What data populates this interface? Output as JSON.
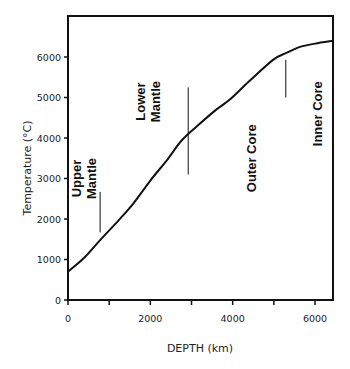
{
  "chart_data": {
    "type": "line",
    "title": "",
    "xlabel": "DEPTH (km)",
    "ylabel": "Temperature (°C)",
    "xlim": [
      0,
      6440
    ],
    "ylim": [
      0,
      6400
    ],
    "grid": false,
    "x_ticks": [
      0,
      1000,
      2000,
      3000,
      4000,
      5000,
      6000
    ],
    "x_tick_labels": [
      "0",
      "",
      "2000",
      "",
      "4000",
      "",
      "6000"
    ],
    "y_ticks": [
      0,
      1000,
      2000,
      3000,
      4000,
      5000,
      6000
    ],
    "y_tick_labels": [
      "0",
      "1000",
      "2000",
      "3000",
      "4000",
      "5000",
      "6000"
    ],
    "series": [
      {
        "name": "Earth temperature profile",
        "x": [
          0,
          400,
          780,
          1240,
          1600,
          2000,
          2400,
          2770,
          3200,
          3600,
          3930,
          4400,
          4980,
          5300,
          5640,
          6000,
          6440
        ],
        "y": [
          700,
          1050,
          1480,
          1980,
          2400,
          2950,
          3450,
          3950,
          4350,
          4700,
          4950,
          5400,
          5930,
          6100,
          6250,
          6330,
          6400
        ]
      }
    ],
    "annotations": [
      {
        "text": "Upper Mantle",
        "lines": [
          "Upper",
          "Mantle"
        ],
        "x": 400,
        "y": 3000,
        "rotation": -90
      },
      {
        "text": "Lower Mantle",
        "lines": [
          "Lower",
          "Mantle"
        ],
        "x": 1950,
        "y": 4900,
        "rotation": -90
      },
      {
        "text": "Outer Core",
        "lines": [
          "Outer Core"
        ],
        "x": 4450,
        "y": 3500,
        "rotation": -90
      },
      {
        "text": "Inner Core",
        "lines": [
          "Inner Core"
        ],
        "x": 6050,
        "y": 4600,
        "rotation": -90
      }
    ],
    "boundary_markers": [
      {
        "x": 780,
        "y_from": 1670,
        "y_to": 2670
      },
      {
        "x": 2920,
        "y_from": 3100,
        "y_to": 5250
      },
      {
        "x": 5290,
        "y_from": 5000,
        "y_to": 5930
      }
    ]
  }
}
